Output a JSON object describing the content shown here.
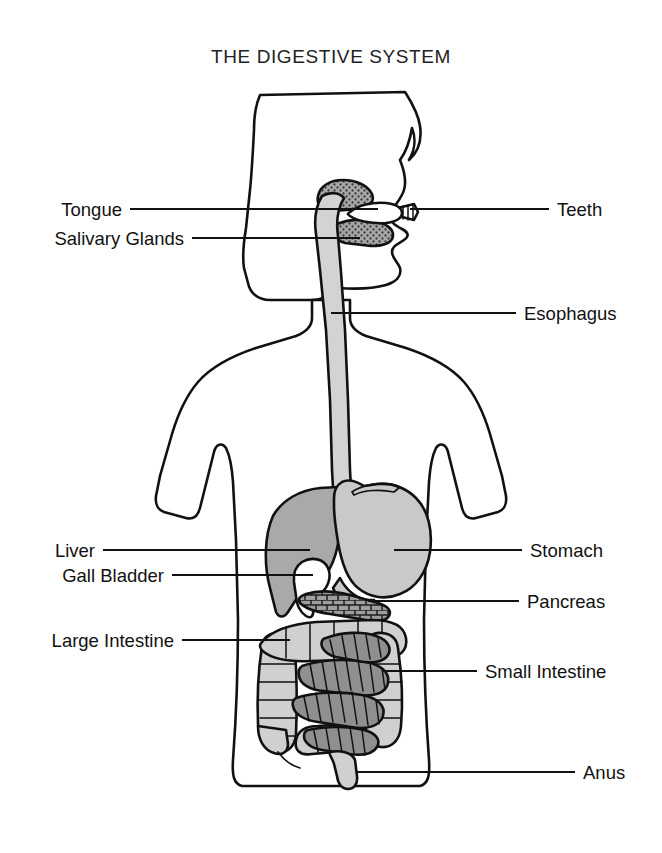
{
  "figure": {
    "title": "THE DIGESTIVE SYSTEM",
    "background_color": "#ffffff",
    "ink_color": "#111111"
  },
  "labels": {
    "left": [
      {
        "key": "tongue",
        "text": "Tongue"
      },
      {
        "key": "salivary_glands",
        "text": "Salivary Glands"
      },
      {
        "key": "liver",
        "text": "Liver"
      },
      {
        "key": "gall_bladder",
        "text": "Gall Bladder"
      },
      {
        "key": "large_intestine",
        "text": "Large Intestine"
      }
    ],
    "right": [
      {
        "key": "teeth",
        "text": "Teeth"
      },
      {
        "key": "esophagus",
        "text": "Esophagus"
      },
      {
        "key": "stomach",
        "text": "Stomach"
      },
      {
        "key": "pancreas",
        "text": "Pancreas"
      },
      {
        "key": "small_intestine",
        "text": "Small Intestine"
      },
      {
        "key": "anus",
        "text": "Anus"
      }
    ]
  },
  "organs": {
    "esophagus": {
      "name": "Esophagus",
      "fill": "#d3d3d3"
    },
    "stomach": {
      "name": "Stomach",
      "fill": "#c9c9c9"
    },
    "liver": {
      "name": "Liver",
      "fill": "#a9a9a9"
    },
    "gall_bladder": {
      "name": "Gall Bladder",
      "fill": "#ffffff"
    },
    "pancreas": {
      "name": "Pancreas",
      "fill": "#9e9e9e"
    },
    "small_intestine": {
      "name": "Small Intestine",
      "fill": "#8f8f8f"
    },
    "large_intestine": {
      "name": "Large Intestine",
      "fill": "#d0d0d0"
    },
    "salivary_glands": {
      "name": "Salivary Glands",
      "fill": "#8f8f8f"
    },
    "tongue": {
      "name": "Tongue",
      "fill": "#ffffff"
    },
    "teeth": {
      "name": "Teeth",
      "fill": "#ffffff"
    },
    "anus": {
      "name": "Anus",
      "fill": "#d0d0d0"
    }
  }
}
